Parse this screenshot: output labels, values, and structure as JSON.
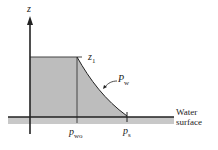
{
  "diagram": {
    "axis_label": "z",
    "height_label": "z",
    "height_label_sub": "1",
    "curve_label": "P",
    "curve_label_sub": "w",
    "tick_label_left": "p",
    "tick_label_left_sub": "wo",
    "tick_label_right": "p",
    "tick_label_right_sub": "s",
    "water_label_line1": "Water",
    "water_label_line2": "surface"
  },
  "colors": {
    "fill": "#bdbdbd",
    "water_band": "#c8c8c8",
    "line": "#222222"
  }
}
